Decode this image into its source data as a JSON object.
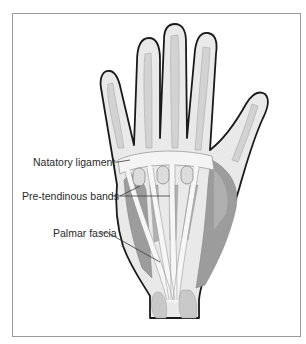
{
  "figure": {
    "labels": [
      {
        "id": "natatory",
        "text": "Natatory ligament",
        "x": 33,
        "y": 158
      },
      {
        "id": "pretendinous",
        "text": "Pre-tendinous bands",
        "x": 22,
        "y": 192
      },
      {
        "id": "palmar",
        "text": "Palmar fascia",
        "x": 53,
        "y": 229
      }
    ],
    "colors": {
      "outline": "#1a1a1a",
      "skin": "#e9e9e9",
      "bone": "#cfcfcf",
      "muscle": "#9c9c9c",
      "muscle_light": "#b8b8b8",
      "fascia": "#f4f4f4",
      "leader": "#3a3a3a",
      "frame": "#9a9a9a"
    }
  }
}
